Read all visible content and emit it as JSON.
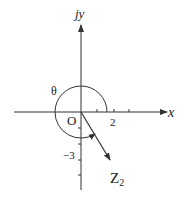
{
  "diagram": {
    "type": "complex-plane",
    "labels": {
      "y_axis": "jy",
      "x_axis": "x",
      "origin": "O",
      "angle": "θ",
      "vector": "Z",
      "vector_subscript": "2",
      "x_tick": "2",
      "y_tick": "−3"
    },
    "vector_point": {
      "x": 2,
      "y": -3
    },
    "colors": {
      "stroke": "#333333",
      "text": "#222222",
      "background": "#ffffff"
    }
  }
}
